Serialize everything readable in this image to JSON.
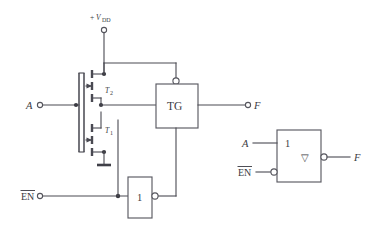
{
  "figure": {
    "type": "circuit-schematic",
    "background_color": "#ffffff",
    "line_color": "#4a4a52",
    "text_color": "#3a3a42"
  },
  "labels": {
    "supply_sign": "+",
    "supply_symbol": "V",
    "supply_subscript": "DD",
    "input_a": "A",
    "enable_bar": "EN",
    "output_f": "F",
    "transistor_top": "T",
    "transistor_top_sub": "2",
    "transistor_bottom": "T",
    "transistor_bottom_sub": "1",
    "tg_box": "TG",
    "inverter_box": "1",
    "symbol_box_label": "1",
    "symbol_tristate_glyph": "▽",
    "symbol_input_a": "A",
    "symbol_enable_bar": "EN",
    "symbol_output_f": "F"
  },
  "left_circuit": {
    "name": "transistor-level-tristate-inverter",
    "supply_terminal": {
      "x": 104,
      "y": 30
    },
    "input_a_terminal": {
      "x": 40,
      "y": 105
    },
    "enable_terminal": {
      "x": 40,
      "y": 196
    },
    "output_f_terminal": {
      "x": 248,
      "y": 105
    },
    "pmos": {
      "label": "T2",
      "type": "p-channel"
    },
    "nmos": {
      "label": "T1",
      "type": "n-channel"
    },
    "transmission_gate": {
      "label": "TG",
      "control_bubble": "top"
    },
    "inverter": {
      "label": "1",
      "output_bubble": "right"
    },
    "ground": {
      "x": 104,
      "y": 165
    }
  },
  "right_symbol": {
    "name": "logic-symbol-tristate-inverter",
    "box_label": "1",
    "tristate_marker": "▽",
    "inputs": [
      {
        "label": "A",
        "bubble": false,
        "y": 143
      },
      {
        "label": "EN",
        "overbar": true,
        "bubble": true,
        "y": 172
      }
    ],
    "output": {
      "label": "F",
      "bubble": true,
      "y": 157
    }
  }
}
